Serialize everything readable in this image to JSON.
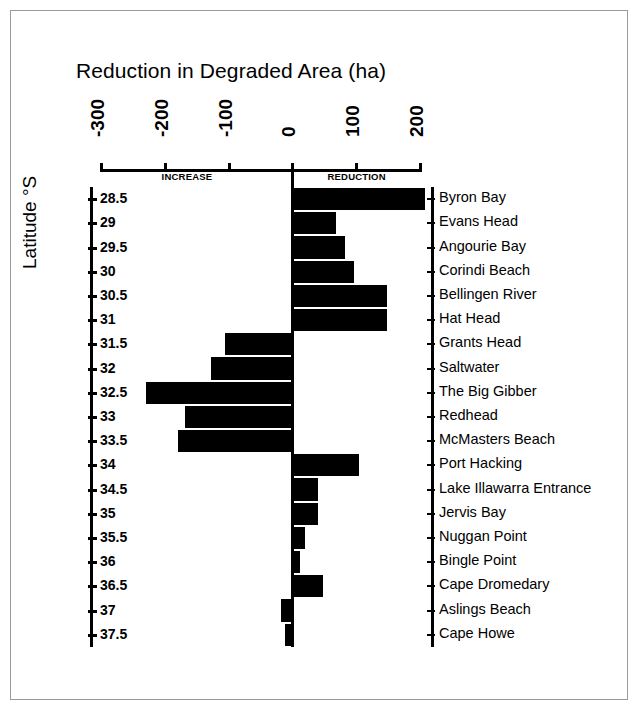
{
  "chart_data": {
    "type": "bar",
    "orientation": "horizontal",
    "title": "Reduction in Degraded Area (ha)",
    "xlabel": "Reduction in Degraded Area (ha)",
    "ylabel": "Latitude °S",
    "xlim": [
      -300,
      200
    ],
    "ylim": [
      28.5,
      37.5
    ],
    "grid": false,
    "legend": null,
    "xticks": [
      -300,
      -200,
      -100,
      0,
      100,
      200
    ],
    "xtick_labels": [
      "-300",
      "-200",
      "-100",
      "0",
      "100",
      "200"
    ],
    "yticks": [
      28.5,
      29,
      29.5,
      30,
      30.5,
      31,
      31.5,
      32,
      32.5,
      33,
      33.5,
      34,
      34.5,
      35,
      35.5,
      36,
      36.5,
      37,
      37.5
    ],
    "ytick_labels": [
      "28.5",
      "29",
      "29.5",
      "30",
      "30.5",
      "31",
      "31.5",
      "32",
      "32.5",
      "33",
      "33.5",
      "34",
      "34.5",
      "35",
      "35.5",
      "36",
      "36.5",
      "37",
      "37.5"
    ],
    "annotations": [
      {
        "text": "INCREASE",
        "side": "left-of-zero"
      },
      {
        "text": "REDUCTION",
        "side": "right-of-zero"
      }
    ],
    "categories": [
      "Byron Bay",
      "Evans Head",
      "Angourie Bay",
      "Corindi Beach",
      "Bellingen River",
      "Hat Head",
      "Grants Head",
      "Saltwater",
      "The Big Gibber",
      "Redhead",
      "McMasters Beach",
      "Port Hacking",
      "Lake Illawarra Entrance",
      "Jervis Bay",
      "Nuggan Point",
      "Bingle Point",
      "Cape Dromedary",
      "Aslings Beach",
      "Cape Howe"
    ],
    "latitudes": [
      28.5,
      29,
      29.5,
      30,
      30.5,
      31,
      31.5,
      32,
      32.5,
      33,
      33.5,
      34,
      34.5,
      35,
      35.5,
      36,
      36.5,
      37,
      37.5
    ],
    "values": [
      208,
      68,
      83,
      97,
      148,
      148,
      -105,
      -127,
      -230,
      -168,
      -180,
      105,
      40,
      40,
      20,
      12,
      48,
      -18,
      -12
    ],
    "bar_color": "#000000"
  },
  "axes": {
    "x_title": "Reduction in Degraded Area (ha)",
    "y_title": "Latitude °S",
    "increase_label": "INCREASE",
    "reduction_label": "REDUCTION"
  }
}
